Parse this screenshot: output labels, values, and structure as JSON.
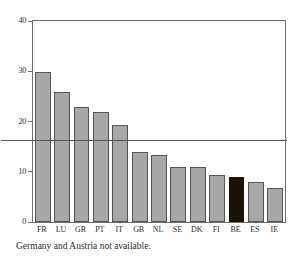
{
  "chart_data": {
    "type": "bar",
    "title": "",
    "subtitle": "",
    "xlabel": "",
    "ylabel": "",
    "categories": [
      "FR",
      "LU",
      "GR",
      "PT",
      "IT",
      "GB",
      "NL",
      "SE",
      "DK",
      "FI",
      "BE",
      "ES",
      "IE"
    ],
    "values": [
      29.8,
      25.8,
      22.8,
      21.8,
      19.3,
      14.0,
      13.3,
      11.0,
      11.0,
      9.4,
      9.0,
      7.9,
      6.7
    ],
    "highlight_category": "BE",
    "ylim": [
      0,
      40
    ],
    "yticks": [
      0,
      10,
      20,
      30,
      40
    ],
    "ytick_labels": [
      "0",
      "10",
      "20",
      "30",
      "40"
    ],
    "grid": false,
    "legend": "none",
    "reference_line": {
      "value": 16.3,
      "label": ""
    },
    "colors": {
      "bar_fill": "#a8a8a8",
      "bar_border": "#555555",
      "highlight_fill": "#1a1208",
      "axis": "#6e6e6e",
      "reference_line": "#555555",
      "text": "#2b2b2b",
      "background": "#ffffff"
    }
  },
  "caption": {
    "text": "Germany and Austria not available."
  }
}
